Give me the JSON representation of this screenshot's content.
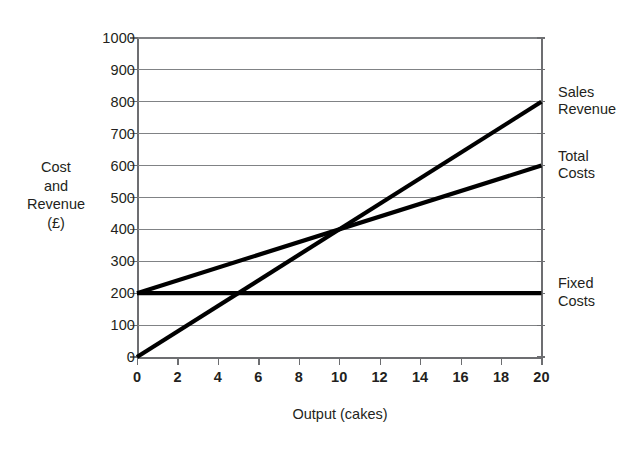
{
  "chart_data": {
    "type": "line",
    "title": "",
    "xlabel": "Output (cakes)",
    "ylabel": "Cost and Revenue (£)",
    "ylabel_lines": "Cost\nand\nRevenue\n(£)",
    "xlim": [
      0,
      20
    ],
    "ylim": [
      0,
      1000
    ],
    "xticks": [
      0,
      2,
      4,
      6,
      8,
      10,
      12,
      14,
      16,
      18,
      20
    ],
    "xtick_labels": [
      "0",
      "2",
      "4",
      "6",
      "8",
      "10",
      "12",
      "14",
      "16",
      "18",
      "20"
    ],
    "yticks": [
      0,
      100,
      200,
      300,
      400,
      500,
      600,
      700,
      800,
      900,
      1000
    ],
    "ytick_labels": [
      "0",
      "100",
      "200",
      "300",
      "400",
      "500",
      "600",
      "700",
      "800",
      "900",
      "1000"
    ],
    "grid": "horizontal",
    "legend_position": "right-of-axis",
    "line_color": "#000000",
    "grid_color": "#808285",
    "axis_color": "#6d6e71",
    "background": "#ffffff",
    "series": [
      {
        "name": "Sales Revenue",
        "label_lines": "Sales\nRevenue",
        "x": [
          0,
          20
        ],
        "values": [
          0,
          800
        ],
        "label_y": 800
      },
      {
        "name": "Total Costs",
        "label_lines": "Total\nCosts",
        "x": [
          0,
          20
        ],
        "values": [
          200,
          600
        ],
        "label_y": 600
      },
      {
        "name": "Fixed Costs",
        "label_lines": "Fixed\nCosts",
        "x": [
          0,
          20
        ],
        "values": [
          200,
          200
        ],
        "label_y": 200
      }
    ],
    "annotations": [
      {
        "name": "break-even-point",
        "x": 10,
        "y": 400,
        "text": ""
      }
    ]
  }
}
